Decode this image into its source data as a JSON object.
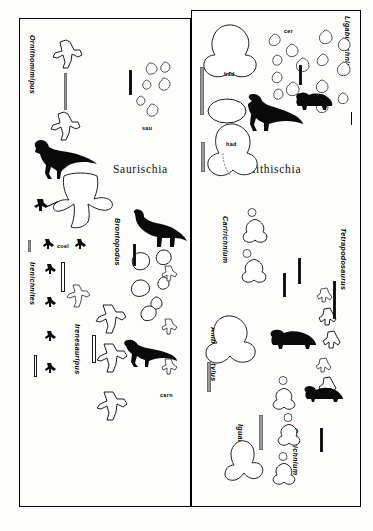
{
  "figure": {
    "panels": [
      {
        "id": "saurischia",
        "clade_heading": "Saurischia"
      },
      {
        "id": "ornithischia",
        "clade_heading": "Ornithischia"
      }
    ],
    "ichnogenera": [
      {
        "name": "Ornithomimipus",
        "panel": "saurischia"
      },
      {
        "name": "Irenichnites",
        "panel": "saurischia"
      },
      {
        "name": "Irenesauripus",
        "panel": "saurischia"
      },
      {
        "name": "Brontopodus",
        "panel": "saurischia"
      },
      {
        "name": "Ligabueichnium",
        "panel": "ornithischia"
      },
      {
        "name": "Caririchnium",
        "panel": "ornithischia"
      },
      {
        "name": "Tetrapodosaurus",
        "panel": "ornithischia"
      },
      {
        "name": "Amblydactylus",
        "panel": "ornithischia"
      },
      {
        "name": "Iguanodon",
        "panel": "ornithischia"
      },
      {
        "name": "Caririchnium2",
        "panel": "ornithischia"
      }
    ],
    "labels": {
      "ornithomimipus": "Ornithomimipus",
      "irenichnites": "Irenichnites",
      "irenesauripus": "Irenesauripus",
      "brontopodus": "Brontopodus",
      "ligabueichnium": "Ligabueichnium",
      "caririchnium_upper": "Caririchnium",
      "tetrapodosaurus": "Tetrapodosaurus",
      "amblydactylus": "Amblydactylus",
      "iguanodon": "Iguanodon",
      "caririchnium_lower": "Caririchnium"
    },
    "taxon_tags": {
      "sau": "sau",
      "coel": "coel",
      "carn": "carn",
      "cer": "cer",
      "had_upper": "had",
      "had_lower": "had"
    },
    "colors": {
      "ink": "#0a0a0a",
      "outline": "#1d1d1d",
      "paper": "#fdfdfc",
      "scalebar_gray": "#9b9b9b"
    }
  }
}
